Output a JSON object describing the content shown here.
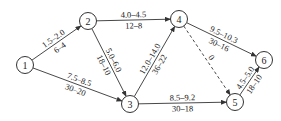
{
  "diagram": {
    "type": "activity-on-arrow network",
    "colors": {
      "stroke": "#333333",
      "text": "#222222",
      "background": "#ffffff"
    },
    "nodes": [
      {
        "id": "1",
        "label": "1",
        "x": 25,
        "y": 65
      },
      {
        "id": "2",
        "label": "2",
        "x": 88,
        "y": 21
      },
      {
        "id": "3",
        "label": "3",
        "x": 130,
        "y": 104
      },
      {
        "id": "4",
        "label": "4",
        "x": 179,
        "y": 19
      },
      {
        "id": "5",
        "label": "5",
        "x": 235,
        "y": 102
      },
      {
        "id": "6",
        "label": "6",
        "x": 264,
        "y": 60
      }
    ],
    "edges": [
      {
        "from": "1",
        "to": "2",
        "top": "1.5–2.0",
        "bottom": "6–4",
        "dashed": false
      },
      {
        "from": "1",
        "to": "3",
        "top": "7.5–8.5",
        "bottom": "30–20",
        "dashed": false
      },
      {
        "from": "2",
        "to": "4",
        "top": "4.0–4.5",
        "bottom": "12–8",
        "dashed": false
      },
      {
        "from": "2",
        "to": "3",
        "top": "5.0–6.0",
        "bottom": "18–10",
        "dashed": false
      },
      {
        "from": "3",
        "to": "4",
        "top": "12.0–14.0",
        "bottom": "36–22",
        "dashed": false
      },
      {
        "from": "3",
        "to": "5",
        "top": "8.5–9.2",
        "bottom": "30–18",
        "dashed": false
      },
      {
        "from": "4",
        "to": "6",
        "top": "9.5–10.3",
        "bottom": "30–16",
        "dashed": false
      },
      {
        "from": "4",
        "to": "5",
        "top": "0",
        "bottom": "",
        "dashed": true
      },
      {
        "from": "5",
        "to": "6",
        "top": "4.5–5.0",
        "bottom": "18–10",
        "dashed": false
      }
    ]
  }
}
